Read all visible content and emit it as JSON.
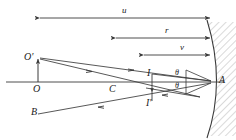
{
  "figure": {
    "type": "optics-ray-diagram",
    "stroke_color": "#3a3a3a",
    "label_color": "#1a1a1a",
    "hatch_color": "#9a9a9a",
    "background": "#ffffff"
  },
  "dimensions": [
    {
      "symbol": "u",
      "meaning": "object-distance",
      "x1": 38,
      "x2": 212,
      "y": 18,
      "label_x": 122,
      "label_y": 7
    },
    {
      "symbol": "r",
      "meaning": "radius-of-curvature",
      "x1": 114,
      "x2": 212,
      "y": 38,
      "label_x": 165,
      "label_y": 27
    },
    {
      "symbol": "v",
      "meaning": "image-distance",
      "x1": 142,
      "x2": 212,
      "y": 55,
      "label_x": 180,
      "label_y": 44
    }
  ],
  "points": [
    {
      "symbol": "O'",
      "meaning": "object-top",
      "x": 38,
      "y": 58,
      "label_x": 25,
      "label_y": 53
    },
    {
      "symbol": "O",
      "meaning": "object-base-on-axis",
      "x": 38,
      "y": 82,
      "label_x": 33,
      "label_y": 85
    },
    {
      "symbol": "B",
      "meaning": "ray-extension-point",
      "x": 38,
      "y": 115,
      "label_x": 33,
      "label_y": 108
    },
    {
      "symbol": "C",
      "meaning": "centre-of-curvature",
      "x": 114,
      "y": 82,
      "label_x": 110,
      "label_y": 85
    },
    {
      "symbol": "I",
      "meaning": "image-point-above-axis",
      "x": 152,
      "y": 76,
      "label_x": 148,
      "label_y": 70
    },
    {
      "symbol": "I'",
      "meaning": "image-point-below-axis",
      "x": 152,
      "y": 95,
      "label_x": 148,
      "label_y": 97
    },
    {
      "symbol": "A",
      "meaning": "mirror-pole-vertex",
      "x": 212,
      "y": 82,
      "label_x": 219,
      "label_y": 76
    }
  ],
  "angles": [
    {
      "symbol": "θ",
      "meaning": "angle-of-incidence",
      "label_x": 175,
      "label_y": 70
    },
    {
      "symbol": "θ",
      "meaning": "angle-of-reflection",
      "label_x": 175,
      "label_y": 82
    }
  ],
  "axis": {
    "meaning": "principal-axis",
    "x1": 6,
    "x2": 224,
    "y": 82
  },
  "mirror": {
    "meaning": "concave-mirror-surface",
    "top_x": 208,
    "top_y": 22,
    "vertex_x": 213,
    "vertex_y": 82,
    "bottom_x": 208,
    "bottom_y": 136
  }
}
